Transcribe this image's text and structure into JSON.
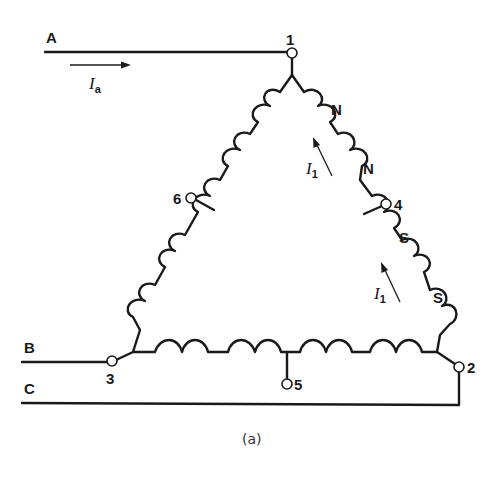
{
  "diagram": {
    "type": "delta-connected winding schematic",
    "caption": "(a)",
    "lines": [
      {
        "id": "line-a",
        "label": "A"
      },
      {
        "id": "line-b",
        "label": "B"
      },
      {
        "id": "line-c",
        "label": "C"
      }
    ],
    "terminals": [
      {
        "id": "t1",
        "label": "1"
      },
      {
        "id": "t2",
        "label": "2"
      },
      {
        "id": "t3",
        "label": "3"
      },
      {
        "id": "t4",
        "label": "4"
      },
      {
        "id": "t5",
        "label": "5"
      },
      {
        "id": "t6",
        "label": "6"
      }
    ],
    "currents": {
      "line": {
        "symbol": "I",
        "subscript": "a"
      },
      "phase_upper": {
        "symbol": "I",
        "subscript": "1"
      },
      "phase_lower": {
        "symbol": "I",
        "subscript": "1"
      }
    },
    "poles": [
      {
        "id": "pole-n-1",
        "label": "N"
      },
      {
        "id": "pole-n-2",
        "label": "N"
      },
      {
        "id": "pole-s-1",
        "label": "S"
      },
      {
        "id": "pole-s-2",
        "label": "S"
      }
    ],
    "colors": {
      "ink": "#1a1a1a",
      "background": "#ffffff"
    }
  }
}
